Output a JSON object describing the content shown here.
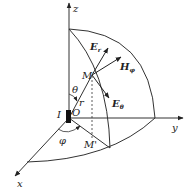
{
  "diagram": {
    "colors": {
      "stroke": "#333333",
      "background": "#ffffff",
      "dipole": "#111111"
    },
    "axes": {
      "z": {
        "label": "z"
      },
      "y": {
        "label": "y"
      },
      "x": {
        "label": "x"
      }
    },
    "points": {
      "origin": "O",
      "field_point": "M",
      "projection": "M'"
    },
    "source": {
      "label": "I"
    },
    "angles": {
      "polar": "θ",
      "azimuth": "φ"
    },
    "radius": {
      "label": "r"
    },
    "vectors": {
      "e_r": {
        "base": "E",
        "sub": "r"
      },
      "h_phi": {
        "base": "H",
        "sub": "φ"
      },
      "e_theta": {
        "base": "E",
        "sub": "θ"
      }
    }
  }
}
